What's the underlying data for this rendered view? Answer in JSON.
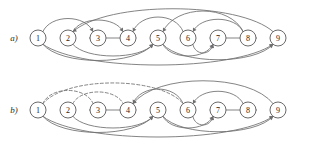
{
  "figure": {
    "width": 310,
    "height": 141,
    "background": "#ffffff",
    "edge_color": "#6e6e6e",
    "node_stroke": "#595959",
    "node_fill": "#ffffff",
    "label_color": "#1e1e1e"
  },
  "panels": [
    {
      "id": "a",
      "label": "a)",
      "label_x": 14,
      "label_y": 41,
      "baseline_y": 38,
      "nodes": [
        {
          "id": "a1",
          "label": "1",
          "x": 38,
          "y": 38,
          "r": 8
        },
        {
          "id": "a2",
          "label": "2",
          "x": 68,
          "y": 38,
          "r": 8
        },
        {
          "id": "a3",
          "label": "3",
          "x": 98,
          "y": 38,
          "r": 8
        },
        {
          "id": "a4",
          "label": "4",
          "x": 128,
          "y": 38,
          "r": 8
        },
        {
          "id": "a5",
          "label": "5",
          "x": 158,
          "y": 38,
          "r": 8
        },
        {
          "id": "a6",
          "label": "6",
          "x": 188,
          "y": 38,
          "r": 8
        },
        {
          "id": "a7",
          "label": "7",
          "x": 218,
          "y": 38,
          "r": 8
        },
        {
          "id": "a8",
          "label": "8",
          "x": 248,
          "y": 38,
          "r": 8
        },
        {
          "id": "a9",
          "label": "9",
          "x": 278,
          "y": 38,
          "r": 8
        }
      ],
      "edges": [
        {
          "from": "1",
          "to": "3",
          "side": "above",
          "style": "solid",
          "depth": 16,
          "arrow": true
        },
        {
          "from": "2",
          "to": "4",
          "side": "above",
          "style": "solid",
          "depth": 14,
          "arrow": true
        },
        {
          "from": "4",
          "to": "3",
          "side": "straight",
          "style": "solid",
          "depth": 0,
          "arrow": true
        },
        {
          "from": "6",
          "to": "4",
          "side": "above",
          "style": "solid",
          "depth": 18,
          "arrow": true
        },
        {
          "from": "8",
          "to": "5",
          "side": "above",
          "style": "solid",
          "depth": 26,
          "arrow": true
        },
        {
          "from": "8",
          "to": "6",
          "side": "above",
          "style": "solid",
          "depth": 15,
          "arrow": true
        },
        {
          "from": "9",
          "to": "2",
          "side": "above",
          "style": "solid",
          "depth": 29,
          "arrow": true
        },
        {
          "from": "7",
          "to": "8",
          "side": "straight",
          "style": "solid",
          "depth": 0,
          "arrow": true
        },
        {
          "from": "1",
          "to": "5",
          "side": "below",
          "style": "solid",
          "depth": 20,
          "arrow": true
        },
        {
          "from": "2",
          "to": "5",
          "side": "below",
          "style": "solid",
          "depth": 14,
          "arrow": true
        },
        {
          "from": "5",
          "to": "7",
          "side": "below",
          "style": "solid",
          "depth": 14,
          "arrow": true
        },
        {
          "from": "6",
          "to": "7",
          "side": "below",
          "style": "solid",
          "depth": 10,
          "arrow": true
        },
        {
          "from": "1",
          "to": "9",
          "side": "below",
          "style": "solid",
          "depth": 26,
          "arrow": true
        },
        {
          "from": "5",
          "to": "9",
          "side": "below",
          "style": "solid",
          "depth": 19,
          "arrow": true
        }
      ]
    },
    {
      "id": "b",
      "label": "b)",
      "label_x": 14,
      "label_y": 113,
      "baseline_y": 110,
      "nodes": [
        {
          "id": "b1",
          "label": "1",
          "x": 38,
          "y": 110,
          "r": 8
        },
        {
          "id": "b2",
          "label": "2",
          "x": 68,
          "y": 110,
          "r": 8
        },
        {
          "id": "b3",
          "label": "3",
          "x": 98,
          "y": 110,
          "r": 8
        },
        {
          "id": "b4",
          "label": "4",
          "x": 128,
          "y": 110,
          "r": 8
        },
        {
          "id": "b5",
          "label": "5",
          "x": 158,
          "y": 110,
          "r": 8
        },
        {
          "id": "b6",
          "label": "6",
          "x": 188,
          "y": 110,
          "r": 8
        },
        {
          "id": "b7",
          "label": "7",
          "x": 218,
          "y": 110,
          "r": 8
        },
        {
          "id": "b8",
          "label": "8",
          "x": 248,
          "y": 110,
          "r": 8
        },
        {
          "id": "b9",
          "label": "9",
          "x": 278,
          "y": 110,
          "r": 8
        }
      ],
      "edges": [
        {
          "from": "1",
          "to": "3",
          "side": "above",
          "style": "dashed",
          "depth": 16,
          "arrow": false
        },
        {
          "from": "2",
          "to": "4",
          "side": "above",
          "style": "dashed",
          "depth": 14,
          "arrow": false
        },
        {
          "from": "1",
          "to": "6",
          "side": "above",
          "style": "dashed",
          "depth": 26,
          "arrow": false
        },
        {
          "from": "4",
          "to": "3",
          "side": "straight",
          "style": "solid",
          "depth": 0,
          "arrow": true
        },
        {
          "from": "6",
          "to": "4",
          "side": "above",
          "style": "solid",
          "depth": 18,
          "arrow": true
        },
        {
          "from": "8",
          "to": "6",
          "side": "above",
          "style": "solid",
          "depth": 15,
          "arrow": true
        },
        {
          "from": "9",
          "to": "4",
          "side": "above",
          "style": "solid",
          "depth": 29,
          "arrow": true
        },
        {
          "from": "7",
          "to": "8",
          "side": "straight",
          "style": "solid",
          "depth": 0,
          "arrow": true
        },
        {
          "from": "1",
          "to": "5",
          "side": "below",
          "style": "solid",
          "depth": 20,
          "arrow": true
        },
        {
          "from": "2",
          "to": "5",
          "side": "below",
          "style": "solid",
          "depth": 14,
          "arrow": true
        },
        {
          "from": "5",
          "to": "7",
          "side": "below",
          "style": "solid",
          "depth": 14,
          "arrow": true
        },
        {
          "from": "6",
          "to": "7",
          "side": "below",
          "style": "solid",
          "depth": 10,
          "arrow": true
        },
        {
          "from": "1",
          "to": "9",
          "side": "below",
          "style": "solid",
          "depth": 26,
          "arrow": true
        },
        {
          "from": "5",
          "to": "9",
          "side": "below",
          "style": "solid",
          "depth": 19,
          "arrow": true
        }
      ]
    }
  ]
}
